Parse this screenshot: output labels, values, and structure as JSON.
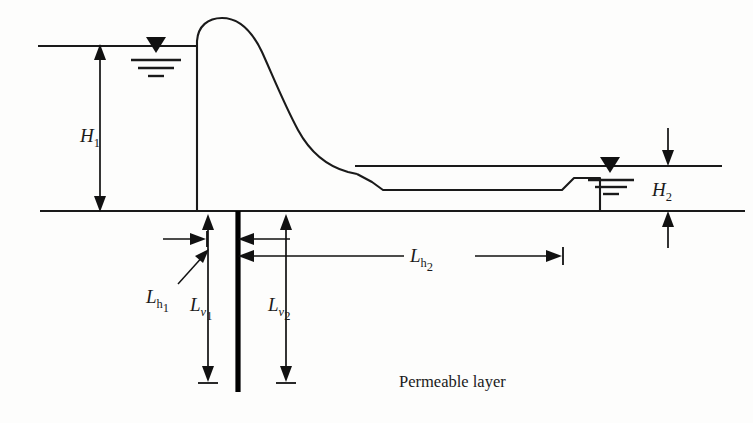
{
  "figure": {
    "type": "engineering-cross-section",
    "background_color": "#fdfdfc",
    "line_color": "#1a1a1a"
  },
  "labels": {
    "h1": {
      "base": "H",
      "sub": "1",
      "full": "H1"
    },
    "h2": {
      "base": "H",
      "sub": "2",
      "full": "H2"
    },
    "lh1": {
      "base": "L",
      "sub": "h",
      "subsub": "1",
      "full": "Lh1"
    },
    "lh2": {
      "base": "L",
      "sub": "h",
      "subsub": "2",
      "full": "Lh2"
    },
    "lv1": {
      "base": "L",
      "sub": "v",
      "subsub": "1",
      "full": "Lv1"
    },
    "lv2": {
      "base": "L",
      "sub": "v",
      "subsub": "2",
      "full": "Lv2"
    },
    "permeable_layer": "Permeable layer"
  },
  "elements": {
    "upstream_water_surface": "upstream water table symbol",
    "downstream_water_surface": "downstream water table symbol",
    "dam_body": "ogee spillway profile",
    "sheet_pile": "vertical sheet pile cutoff wall",
    "ground_surface": "ground / foundation contact line",
    "apron": "downstream concrete apron with end step"
  },
  "geometry": {
    "ground_line_y": 211,
    "upstream_water_y": 46,
    "downstream_water_y": 166,
    "sheet_pile_x": 238,
    "sheet_pile_bottom_y": 392,
    "dam_upstream_face_x": 197,
    "apron_toe_x": 570
  }
}
